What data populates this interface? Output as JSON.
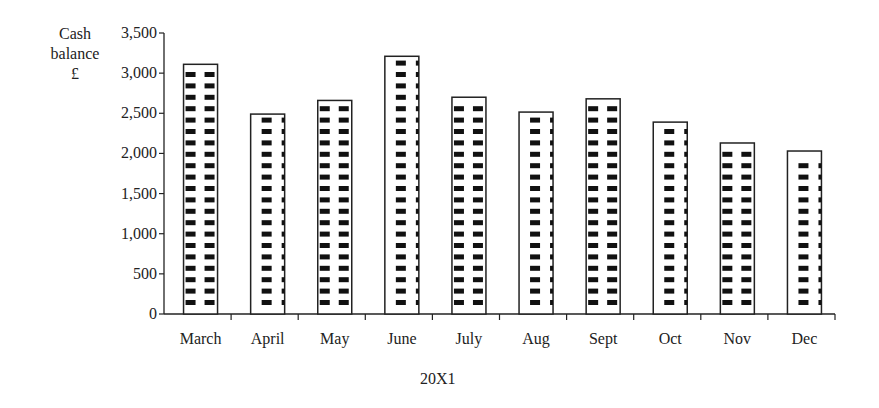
{
  "chart_data": {
    "type": "bar",
    "title": "",
    "ylabel": "Cash balance £",
    "xlabel": "20X1",
    "categories": [
      "March",
      "April",
      "May",
      "June",
      "July",
      "Aug",
      "Sept",
      "Oct",
      "Nov",
      "Dec"
    ],
    "values": [
      3110,
      2490,
      2660,
      3210,
      2700,
      2515,
      2680,
      2390,
      2130,
      2030
    ],
    "ylim": [
      0,
      3500
    ],
    "yticks": [
      "0",
      "500",
      "1,000",
      "1,500",
      "2,000",
      "2,500",
      "3,000",
      "3,500"
    ],
    "grid": false,
    "legend": null,
    "bar_pattern": "white bars with black dashed stripe pattern"
  },
  "labels": {
    "ylabel_line1": "Cash",
    "ylabel_line2": "balance",
    "ylabel_line3": "£",
    "xlabel": "20X1"
  }
}
